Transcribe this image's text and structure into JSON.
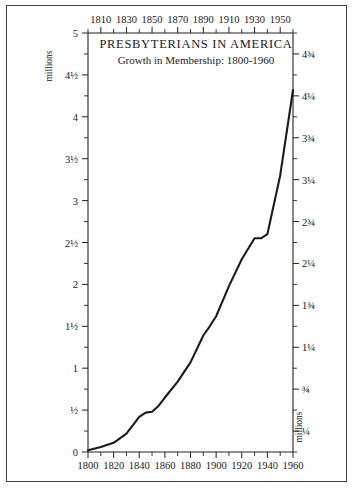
{
  "figure": {
    "unit_label_left": "millions",
    "unit_label_right": "millions"
  },
  "chart_data": {
    "type": "line",
    "title": "PRESBYTERIANS IN AMERICA",
    "subtitle": "Growth in Membership: 1800-1960",
    "xlabel": "",
    "ylabel": "millions",
    "xlim": [
      1800,
      1960
    ],
    "ylim": [
      0,
      5
    ],
    "grid": false,
    "legend": null,
    "x_ticks_bottom": [
      {
        "value": 1800,
        "label": "1800"
      },
      {
        "value": 1810,
        "label": ""
      },
      {
        "value": 1820,
        "label": "1820"
      },
      {
        "value": 1830,
        "label": ""
      },
      {
        "value": 1840,
        "label": "1840"
      },
      {
        "value": 1850,
        "label": ""
      },
      {
        "value": 1860,
        "label": "1860"
      },
      {
        "value": 1870,
        "label": ""
      },
      {
        "value": 1880,
        "label": "1880"
      },
      {
        "value": 1890,
        "label": ""
      },
      {
        "value": 1900,
        "label": "1900"
      },
      {
        "value": 1910,
        "label": ""
      },
      {
        "value": 1920,
        "label": "1920"
      },
      {
        "value": 1930,
        "label": ""
      },
      {
        "value": 1940,
        "label": "1940"
      },
      {
        "value": 1950,
        "label": ""
      },
      {
        "value": 1960,
        "label": "1960"
      }
    ],
    "x_ticks_top": [
      {
        "value": 1800,
        "label": ""
      },
      {
        "value": 1810,
        "label": "1810"
      },
      {
        "value": 1820,
        "label": ""
      },
      {
        "value": 1830,
        "label": "1830"
      },
      {
        "value": 1840,
        "label": ""
      },
      {
        "value": 1850,
        "label": "1850"
      },
      {
        "value": 1860,
        "label": ""
      },
      {
        "value": 1870,
        "label": "1870"
      },
      {
        "value": 1880,
        "label": ""
      },
      {
        "value": 1890,
        "label": "1890"
      },
      {
        "value": 1900,
        "label": ""
      },
      {
        "value": 1910,
        "label": "1910"
      },
      {
        "value": 1920,
        "label": ""
      },
      {
        "value": 1930,
        "label": "1930"
      },
      {
        "value": 1940,
        "label": ""
      },
      {
        "value": 1950,
        "label": "1950"
      },
      {
        "value": 1960,
        "label": ""
      }
    ],
    "y_ticks_left": [
      {
        "value": 0,
        "label": "0"
      },
      {
        "value": 0.25,
        "label": ""
      },
      {
        "value": 0.5,
        "label": "½"
      },
      {
        "value": 0.75,
        "label": ""
      },
      {
        "value": 1,
        "label": "1"
      },
      {
        "value": 1.25,
        "label": ""
      },
      {
        "value": 1.5,
        "label": "1½"
      },
      {
        "value": 1.75,
        "label": ""
      },
      {
        "value": 2,
        "label": "2"
      },
      {
        "value": 2.25,
        "label": ""
      },
      {
        "value": 2.5,
        "label": "2½"
      },
      {
        "value": 2.75,
        "label": ""
      },
      {
        "value": 3,
        "label": "3"
      },
      {
        "value": 3.25,
        "label": ""
      },
      {
        "value": 3.5,
        "label": "3½"
      },
      {
        "value": 3.75,
        "label": ""
      },
      {
        "value": 4,
        "label": "4"
      },
      {
        "value": 4.25,
        "label": ""
      },
      {
        "value": 4.5,
        "label": "4½"
      },
      {
        "value": 4.75,
        "label": ""
      },
      {
        "value": 5,
        "label": "5"
      }
    ],
    "y_ticks_right": [
      {
        "value": 0,
        "label": ""
      },
      {
        "value": 0.25,
        "label": "¼"
      },
      {
        "value": 0.5,
        "label": ""
      },
      {
        "value": 0.75,
        "label": "¾"
      },
      {
        "value": 1,
        "label": ""
      },
      {
        "value": 1.25,
        "label": "1¼"
      },
      {
        "value": 1.5,
        "label": ""
      },
      {
        "value": 1.75,
        "label": "1¾"
      },
      {
        "value": 2,
        "label": ""
      },
      {
        "value": 2.25,
        "label": "2¼"
      },
      {
        "value": 2.5,
        "label": ""
      },
      {
        "value": 2.75,
        "label": "2¾"
      },
      {
        "value": 3,
        "label": ""
      },
      {
        "value": 3.25,
        "label": "3¼"
      },
      {
        "value": 3.5,
        "label": ""
      },
      {
        "value": 3.75,
        "label": "3¾"
      },
      {
        "value": 4,
        "label": ""
      },
      {
        "value": 4.25,
        "label": "4¼"
      },
      {
        "value": 4.5,
        "label": ""
      },
      {
        "value": 4.75,
        "label": "4¾"
      },
      {
        "value": 5,
        "label": ""
      }
    ],
    "x": [
      1800,
      1810,
      1820,
      1830,
      1840,
      1845,
      1850,
      1855,
      1860,
      1870,
      1880,
      1890,
      1895,
      1900,
      1910,
      1920,
      1930,
      1935,
      1940,
      1950,
      1960
    ],
    "values": [
      0.02,
      0.06,
      0.11,
      0.22,
      0.42,
      0.47,
      0.48,
      0.55,
      0.65,
      0.84,
      1.07,
      1.39,
      1.5,
      1.62,
      1.98,
      2.3,
      2.55,
      2.55,
      2.6,
      3.3,
      4.32
    ],
    "series": [
      {
        "name": "Presbyterian membership",
        "values": [
          0.02,
          0.06,
          0.11,
          0.22,
          0.42,
          0.47,
          0.48,
          0.55,
          0.65,
          0.84,
          1.07,
          1.39,
          1.5,
          1.62,
          1.98,
          2.3,
          2.55,
          2.55,
          2.6,
          3.3,
          4.32
        ]
      }
    ]
  }
}
